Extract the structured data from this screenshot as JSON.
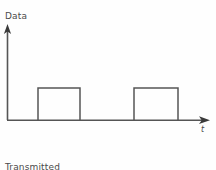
{
  "figure": {
    "background_color": "#fefefe",
    "stroke_color": "#555555",
    "text_color": "#4a4a4a",
    "y_axis_label": "Data",
    "x_axis_label": "t",
    "caption_line1": "Transmitted",
    "caption_line2": "signal",
    "caption_cut_off": "",
    "icons": {
      "y_arrow": "arrow-up-icon",
      "x_arrow": "arrow-right-icon"
    }
  },
  "chart_data": {
    "type": "line",
    "title": "",
    "subtitle": "",
    "xlabel": "t",
    "ylabel": "Data",
    "grid": false,
    "legend": null,
    "annotations": [
      "Transmitted signal"
    ],
    "xlim": [
      0,
      216
    ],
    "ylim": [
      0,
      1
    ],
    "axis_origin_px": [
      7,
      120
    ],
    "x_axis_end_px": 210,
    "y_axis_top_px": 25,
    "high_level_px": 88,
    "low_level_px": 120,
    "series": [
      {
        "name": "Transmitted signal",
        "step_points_px": [
          [
            7,
            120
          ],
          [
            38,
            120
          ],
          [
            38,
            88
          ],
          [
            80,
            88
          ],
          [
            80,
            120
          ],
          [
            134,
            120
          ],
          [
            134,
            88
          ],
          [
            178,
            88
          ],
          [
            178,
            120
          ],
          [
            205,
            120
          ]
        ],
        "levels": [
          0,
          0,
          1,
          1,
          0,
          0,
          1,
          1,
          0,
          0
        ]
      }
    ],
    "pulses": [
      {
        "index": 1,
        "x_start_px": 38,
        "x_end_px": 80,
        "level": 1,
        "width_px": 42
      },
      {
        "index": 2,
        "x_start_px": 134,
        "x_end_px": 178,
        "level": 1,
        "width_px": 44
      }
    ]
  }
}
